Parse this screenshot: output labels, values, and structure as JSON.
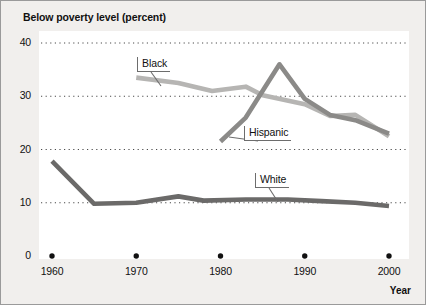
{
  "chart_data": {
    "type": "line",
    "title": "Below poverty level (percent)",
    "xlabel": "Year",
    "ylabel": "",
    "xlim": [
      1960,
      2001
    ],
    "ylim": [
      0,
      40
    ],
    "grid": "horizontal-dotted",
    "legend_position": "inline-callout",
    "xticks": [
      "1960",
      "1970",
      "1980",
      "1990",
      "2000"
    ],
    "xtick_values": [
      1960,
      1970,
      1980,
      1990,
      2000
    ],
    "yticks": [
      "0",
      "10",
      "20",
      "30",
      "40"
    ],
    "ytick_values": [
      0,
      10,
      20,
      30,
      40
    ],
    "series": [
      {
        "name": "Black",
        "color": "#b6b5b3",
        "x": [
          1970,
          1975,
          1979,
          1983,
          1985,
          1990,
          1993,
          1996,
          2000
        ],
        "values": [
          33.5,
          32.5,
          31.0,
          31.8,
          30.2,
          28.5,
          26.3,
          26.5,
          22.5
        ]
      },
      {
        "name": "Hispanic",
        "color": "#8b8a88",
        "x": [
          1980,
          1983,
          1987,
          1990,
          1993,
          1996,
          2000
        ],
        "values": [
          21.5,
          26.0,
          36.0,
          29.5,
          26.5,
          25.5,
          23.0
        ]
      },
      {
        "name": "White",
        "color": "#6b6a69",
        "x": [
          1960,
          1965,
          1970,
          1975,
          1978,
          1983,
          1988,
          1992,
          1996,
          2000
        ],
        "values": [
          17.8,
          9.8,
          10.0,
          11.2,
          10.4,
          10.6,
          10.6,
          10.3,
          10.0,
          9.4
        ]
      }
    ],
    "annotations": [
      {
        "text": "Black",
        "box_x": 136,
        "box_y": 56,
        "leader_to_x": 160,
        "leader_to_y": 85
      },
      {
        "text": "Hispanic",
        "box_x": 243,
        "box_y": 125,
        "leader_to_x": 228,
        "leader_to_y": 136
      },
      {
        "text": "White",
        "box_x": 254,
        "box_y": 172,
        "leader_to_x": 277,
        "leader_to_y": 201
      }
    ]
  }
}
